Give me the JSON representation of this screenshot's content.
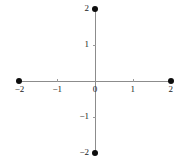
{
  "chart_data": {
    "type": "scatter",
    "title": "",
    "xlabel": "",
    "ylabel": "",
    "xlim": [
      -2.3,
      2.3
    ],
    "ylim": [
      -2.3,
      2.3
    ],
    "grid": false,
    "legend": null,
    "points": [
      {
        "label": "top-point",
        "x": 0,
        "y": 2
      },
      {
        "label": "left-point",
        "x": -2,
        "y": 0
      },
      {
        "label": "right-point",
        "x": 2,
        "y": 0
      },
      {
        "label": "bottom-point",
        "x": 0,
        "y": -2
      }
    ],
    "x_ticks": [
      {
        "value": -2,
        "label": "−2"
      },
      {
        "value": -1,
        "label": "−1"
      },
      {
        "value": 0,
        "label": "0"
      },
      {
        "value": 1,
        "label": "1"
      },
      {
        "value": 2,
        "label": "2"
      }
    ],
    "y_ticks": [
      {
        "value": 2,
        "label": "2"
      },
      {
        "value": 1,
        "label": "1"
      },
      {
        "value": -1,
        "label": "−1"
      },
      {
        "value": -2,
        "label": "−2"
      }
    ],
    "colors": {
      "point": "#0d0d0d",
      "axis": "#8c8c8c",
      "tick": "#9a9a9a",
      "text": "#1a1a1a",
      "background": "#ffffff"
    },
    "pixel_geometry": {
      "origin_x": 95,
      "origin_y": 81,
      "unit_x": 37.8,
      "unit_y": 36.2
    }
  }
}
